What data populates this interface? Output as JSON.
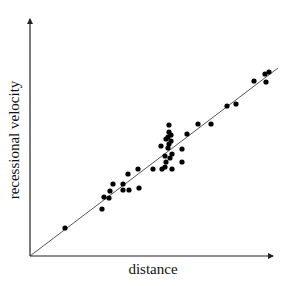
{
  "chart_data": {
    "type": "scatter",
    "title": "",
    "xlabel": "distance",
    "ylabel": "recessional velocity",
    "xlim": [
      0,
      250
    ],
    "ylim": [
      0,
      240
    ],
    "grid": false,
    "legend": null,
    "ticks": "none",
    "colors": {
      "points": "#000000",
      "fit_line": "#555555",
      "axes": "#222222"
    },
    "series": [
      {
        "name": "galaxies",
        "kind": "points",
        "x": [
          35,
          72,
          74,
          79,
          80,
          83,
          93,
          93,
          98,
          99,
          108,
          109,
          123,
          131,
          132,
          135,
          135,
          136,
          136,
          138,
          138,
          139,
          139,
          139,
          140,
          141,
          141,
          142,
          142,
          152,
          152,
          157,
          168,
          181,
          197,
          206,
          224,
          235,
          236,
          239
        ],
        "y": [
          28,
          47,
          59,
          58,
          65,
          72,
          72,
          66,
          82,
          66,
          87,
          68,
          87,
          110,
          87,
          89,
          100,
          94,
          117,
          108,
          119,
          112,
          131,
          124,
          98,
          115,
          121,
          87,
          102,
          107,
          94,
          122,
          132,
          132,
          150,
          152,
          175,
          182,
          174,
          184
        ]
      },
      {
        "name": "fit_line",
        "kind": "line",
        "x": [
          0,
          248
        ],
        "y": [
          0,
          188
        ]
      }
    ]
  }
}
